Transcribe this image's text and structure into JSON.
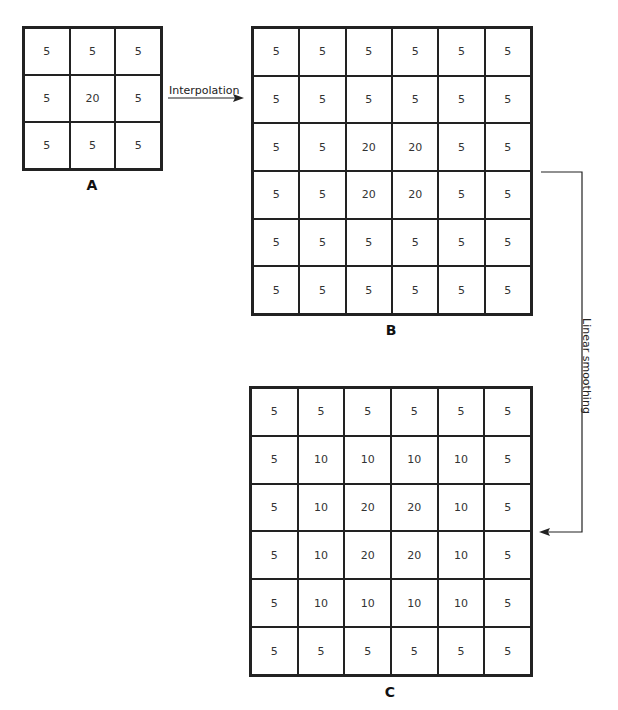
{
  "grids": {
    "A": {
      "caption": "A",
      "cells": [
        [
          "5",
          "5",
          "5"
        ],
        [
          "5",
          "20",
          "5"
        ],
        [
          "5",
          "5",
          "5"
        ]
      ]
    },
    "B": {
      "caption": "B",
      "cells": [
        [
          "5",
          "5",
          "5",
          "5",
          "5",
          "5"
        ],
        [
          "5",
          "5",
          "5",
          "5",
          "5",
          "5"
        ],
        [
          "5",
          "5",
          "20",
          "20",
          "5",
          "5"
        ],
        [
          "5",
          "5",
          "20",
          "20",
          "5",
          "5"
        ],
        [
          "5",
          "5",
          "5",
          "5",
          "5",
          "5"
        ],
        [
          "5",
          "5",
          "5",
          "5",
          "5",
          "5"
        ]
      ]
    },
    "C": {
      "caption": "C",
      "cells": [
        [
          "5",
          "5",
          "5",
          "5",
          "5",
          "5"
        ],
        [
          "5",
          "10",
          "10",
          "10",
          "10",
          "5"
        ],
        [
          "5",
          "10",
          "20",
          "20",
          "10",
          "5"
        ],
        [
          "5",
          "10",
          "20",
          "20",
          "10",
          "5"
        ],
        [
          "5",
          "10",
          "10",
          "10",
          "10",
          "5"
        ],
        [
          "5",
          "5",
          "5",
          "5",
          "5",
          "5"
        ]
      ]
    }
  },
  "arrows": {
    "interpolation_label": "Interpolation",
    "smoothing_label": "Linear smoothing"
  }
}
